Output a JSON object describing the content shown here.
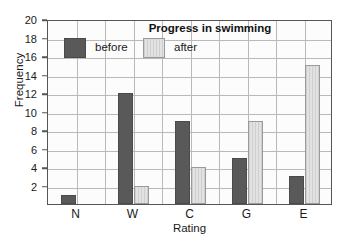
{
  "chart_data": {
    "type": "bar",
    "title": "Progress in swimming",
    "xlabel": "Rating",
    "ylabel": "Frequency",
    "categories": [
      "N",
      "W",
      "C",
      "G",
      "E"
    ],
    "series": [
      {
        "name": "before",
        "values": [
          1,
          12,
          9,
          5,
          3
        ],
        "color": "#595959"
      },
      {
        "name": "after",
        "values": [
          0,
          2,
          4,
          9,
          15
        ],
        "color": "#d8d8d8"
      }
    ],
    "ylim": [
      0,
      20
    ],
    "ytick_values": [
      2,
      4,
      6,
      8,
      10,
      12,
      14,
      16,
      18,
      20
    ],
    "ytick_labels": [
      "2",
      "4",
      "6",
      "8",
      "10",
      "12",
      "14",
      "16",
      "18",
      "20"
    ],
    "grid": true,
    "legend_position": "top-left-inside"
  },
  "legend": {
    "before_label": "before",
    "after_label": "after"
  }
}
